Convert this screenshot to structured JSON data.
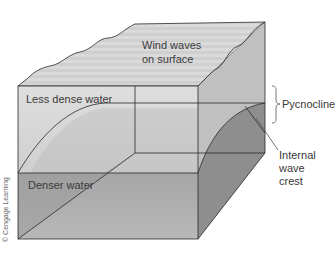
{
  "figure": {
    "labels": {
      "surface": [
        "Wind waves",
        "on surface"
      ],
      "upper_layer": "Less dense water",
      "lower_layer": "Denser water",
      "pycnocline": "Pycnocline",
      "internal_wave": [
        "Internal",
        "wave",
        "crest"
      ]
    },
    "credit": "© Cengage Learning",
    "colors": {
      "upper_water": "#d6d6d6",
      "lower_water": "#9a9a9a",
      "surface": "#c8c8c8",
      "right_face": "#bcbcbc",
      "outline": "#2a2a2a"
    }
  }
}
